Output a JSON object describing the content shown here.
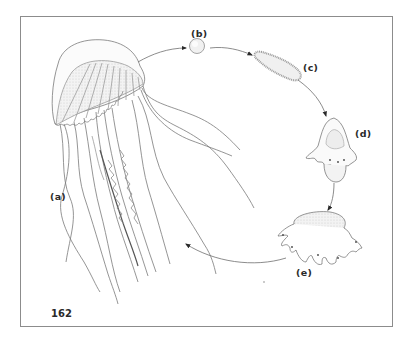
{
  "figure": {
    "page_number": "162",
    "stages": [
      {
        "id": "a",
        "label": "(a)",
        "name": "adult medusa"
      },
      {
        "id": "b",
        "label": "(b)",
        "name": "egg"
      },
      {
        "id": "c",
        "label": "(c)",
        "name": "planula larva"
      },
      {
        "id": "d",
        "label": "(d)",
        "name": "scyphistoma / strobila"
      },
      {
        "id": "e",
        "label": "(e)",
        "name": "ephyra"
      }
    ],
    "arrows": [
      {
        "from": "a",
        "to": "b"
      },
      {
        "from": "b",
        "to": "c"
      },
      {
        "from": "c",
        "to": "d"
      },
      {
        "from": "d",
        "to": "e"
      },
      {
        "from": "e",
        "to": "a"
      }
    ],
    "colors": {
      "line": "#6e6e6e",
      "label": "#2a2a2a",
      "frame": "#8c8c8c",
      "fill_light": "#ececec"
    }
  }
}
